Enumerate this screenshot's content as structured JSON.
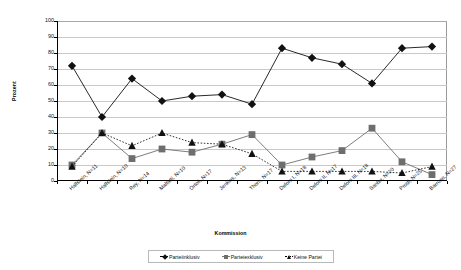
{
  "chart_data": {
    "type": "line",
    "title": "",
    "xlabel": "Kommission",
    "ylabel": "Prozent",
    "ylim": [
      0,
      100
    ],
    "ytick_step": 10,
    "yticks": [
      "0",
      "10",
      "20",
      "30",
      "40",
      "50",
      "60",
      "70",
      "80",
      "90",
      "100"
    ],
    "grid": true,
    "legend_position": "bottom",
    "categories": [
      "Hallstein, N=11",
      "Hallstein, N=10",
      "Rey,    N=14",
      "Malfatti, N=10",
      "Ortoli, N=17",
      "Jenkins, N=13",
      "Thorn, N=17",
      "Delors I, N=18",
      "Delors II, N=17",
      "Delors III, N=18",
      "Santer, N=20",
      "Prodi, N=25",
      "Barroso, N=27"
    ],
    "series": [
      {
        "name": "Parteiinklusiv",
        "marker": "diamond",
        "line": "solid",
        "color": "#111111",
        "values": [
          72,
          40,
          64,
          50,
          53,
          54,
          48,
          83,
          77,
          73,
          61,
          83,
          84
        ]
      },
      {
        "name": "Parteiexklusiv",
        "marker": "square",
        "line": "solid",
        "color": "#6e6e6e",
        "values": [
          10,
          30,
          14,
          20,
          18,
          23,
          29,
          10,
          15,
          19,
          33,
          12,
          4
        ]
      },
      {
        "name": "Keine Partei",
        "marker": "triangle",
        "line": "dotted",
        "color": "#111111",
        "values": [
          9,
          30,
          22,
          30,
          24,
          23,
          17,
          6,
          6,
          6,
          6,
          5,
          9
        ]
      }
    ]
  }
}
